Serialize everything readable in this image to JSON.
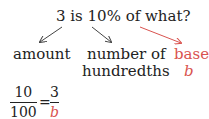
{
  "question": "3 is 10% of what?",
  "labels": {
    "amount": "amount",
    "number_line1": "number of",
    "number_line2": "hundredths",
    "base_line1": "base,",
    "base_line2": "b"
  },
  "equation": {
    "left_num": "10",
    "left_den": "100",
    "equals": "=",
    "right_num": "3",
    "right_den": "b"
  },
  "colors": {
    "text": "#222222",
    "accent": "#d9534f"
  }
}
